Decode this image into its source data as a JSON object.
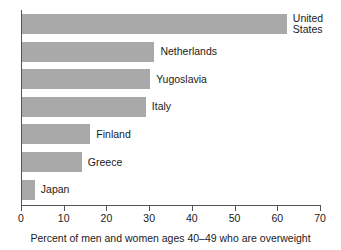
{
  "chart_data": {
    "type": "bar",
    "orientation": "horizontal",
    "title": "",
    "subtitle": "",
    "xlabel": "Percent of men and women ages 40–49 who are overweight",
    "ylabel": "",
    "categories": [
      "United States",
      "Netherlands",
      "Yugoslavia",
      "Italy",
      "Finland",
      "Greece",
      "Japan"
    ],
    "values": [
      62,
      31,
      30,
      29,
      16,
      14,
      3
    ],
    "bar_labels": [
      "United States",
      "Netherlands",
      "Yugoslavia",
      "Italy",
      "Finland",
      "Greece",
      "Japan"
    ],
    "xlim": [
      0,
      70
    ],
    "xticks": [
      0,
      10,
      20,
      30,
      40,
      50,
      60,
      70
    ],
    "xtick_labels": [
      "0",
      "10",
      "20",
      "30",
      "40",
      "50",
      "60",
      "70"
    ],
    "grid": false,
    "legend": false,
    "bar_color": "#a9a9a9",
    "axis_color": "#555555",
    "text_color": "#1a1a1a"
  },
  "caption": {
    "text": "Percent of men and women ages 40–49 who are overweight"
  }
}
